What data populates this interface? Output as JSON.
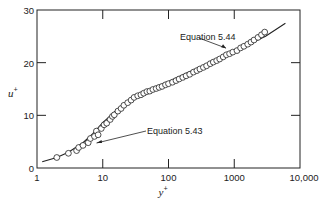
{
  "chart_data": {
    "type": "scatter",
    "title": "",
    "xlabel": "y+",
    "ylabel": "u+",
    "xscale": "log",
    "xlim": [
      1,
      10000
    ],
    "ylim": [
      0,
      30
    ],
    "x_ticks": [
      1,
      10,
      100,
      1000,
      10000
    ],
    "x_tick_labels": [
      "1",
      "10",
      "100",
      "1000",
      "10,000"
    ],
    "y_ticks": [
      0,
      10,
      20,
      30
    ],
    "y_tick_labels": [
      "0",
      "10",
      "20",
      "30"
    ],
    "grid": false,
    "legend": null,
    "annotations": [
      {
        "text": "Equation 5.44",
        "arrow_to": [
          750,
          22.0
        ],
        "text_pos": [
          140,
          25.5
        ]
      },
      {
        "text": "Equation 5.43",
        "arrow_to": [
          7.5,
          5.5
        ],
        "text_pos": [
          45,
          8.5
        ]
      }
    ],
    "series": [
      {
        "name": "measured data",
        "marker": "open-circle",
        "x": [
          2.0,
          3.0,
          4.0,
          4.3,
          5.0,
          6.0,
          6.5,
          7.5,
          8.0,
          8.5,
          9.5,
          10.5,
          11.5,
          13,
          14,
          15,
          17,
          19,
          21,
          24,
          27,
          30,
          34,
          38,
          42,
          47,
          52,
          58,
          65,
          72,
          80,
          90,
          100,
          115,
          130,
          145,
          165,
          185,
          210,
          240,
          270,
          300,
          340,
          380,
          430,
          480,
          540,
          600,
          680,
          760,
          850,
          950,
          1100,
          1250,
          1400,
          1600,
          1800,
          2000,
          2300,
          2600,
          2900
        ],
        "y": [
          2.0,
          2.8,
          3.3,
          3.9,
          4.3,
          4.8,
          5.6,
          6.0,
          7.0,
          6.3,
          7.5,
          8.2,
          8.5,
          9.2,
          9.8,
          10.1,
          10.8,
          11.3,
          11.9,
          12.4,
          12.9,
          13.4,
          13.7,
          13.9,
          14.2,
          14.5,
          14.6,
          14.9,
          15.1,
          15.3,
          15.5,
          15.8,
          16.0,
          16.3,
          16.6,
          16.9,
          17.2,
          17.5,
          17.8,
          18.2,
          18.5,
          18.8,
          19.1,
          19.4,
          19.8,
          20.1,
          20.4,
          20.7,
          21.1,
          21.5,
          21.7,
          22.0,
          22.3,
          22.8,
          23.1,
          23.5,
          23.9,
          24.3,
          24.8,
          25.3,
          25.8
        ]
      },
      {
        "name": "Equation 5.43 / 5.44 fit",
        "marker": "line",
        "x": [
          1.2,
          2,
          3,
          5,
          7,
          10,
          15,
          20,
          30,
          50,
          100,
          300,
          1000,
          3000,
          6000
        ],
        "y": [
          1.2,
          2.0,
          3.0,
          4.8,
          6.5,
          8.6,
          10.6,
          11.9,
          13.4,
          14.7,
          16.4,
          19.2,
          22.2,
          25.0,
          27.5
        ]
      }
    ]
  }
}
